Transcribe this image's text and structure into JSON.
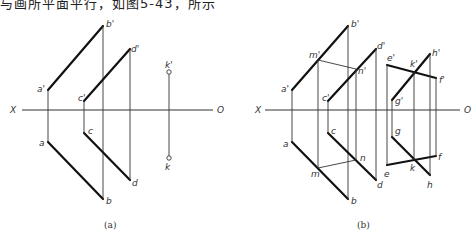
{
  "header": {
    "cut_text": "与画所平面平行，如图5-43，所示"
  },
  "figures": [
    {
      "caption": "(a)",
      "axis": {
        "left_label": "X",
        "right_label": "O"
      },
      "labels": {
        "a1": "a'",
        "b1": "b'",
        "c1": "c'",
        "d1": "d'",
        "a": "a",
        "b": "b",
        "c": "c",
        "d": "d",
        "k1": "k'",
        "k": "k"
      }
    },
    {
      "caption": "(b)",
      "axis": {
        "left_label": "X",
        "right_label": "O"
      },
      "labels": {
        "a1": "a'",
        "b1": "b'",
        "c1": "c'",
        "d1": "d'",
        "m1": "m'",
        "n1": "n'",
        "a": "a",
        "b": "b",
        "c": "c",
        "d": "d",
        "m": "m",
        "n": "n",
        "e1": "e'",
        "f1": "f'",
        "g1": "g'",
        "h1": "h'",
        "k1": "k'",
        "e": "e",
        "f": "f",
        "g": "g",
        "h": "h",
        "k": "k"
      }
    }
  ]
}
